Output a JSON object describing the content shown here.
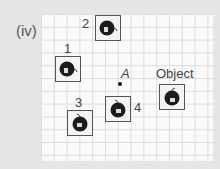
{
  "figure": {
    "part_label": "(iv)",
    "point_label": "A",
    "object_label": "Object",
    "images": [
      {
        "id": "1",
        "label": "1"
      },
      {
        "id": "2",
        "label": "2"
      },
      {
        "id": "3",
        "label": "3"
      },
      {
        "id": "4",
        "label": "4"
      }
    ]
  }
}
